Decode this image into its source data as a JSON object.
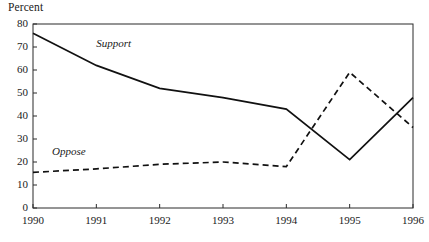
{
  "chart_data": {
    "type": "line",
    "title": "",
    "ylabel": "Percent",
    "xlabel": "",
    "x": [
      1990,
      1991,
      1992,
      1993,
      1994,
      1995,
      1996
    ],
    "xtick_labels": [
      "1990",
      "1991",
      "1992",
      "1993",
      "1994",
      "1995",
      "1996"
    ],
    "ytick_labels": [
      "0",
      "10",
      "20",
      "30",
      "40",
      "50",
      "60",
      "70",
      "80"
    ],
    "yticks": [
      0,
      10,
      20,
      30,
      40,
      50,
      60,
      70,
      80
    ],
    "ylim": [
      0,
      80
    ],
    "xlim": [
      1990,
      1996
    ],
    "grid": false,
    "legend": "inline-labels",
    "series": [
      {
        "name": "Support",
        "style": "solid",
        "color": "#111111",
        "values": [
          76,
          62,
          52,
          48,
          43,
          21,
          48
        ]
      },
      {
        "name": "Oppose",
        "style": "dashed",
        "color": "#111111",
        "values": [
          15.5,
          17,
          19,
          20,
          18,
          59,
          35
        ]
      }
    ],
    "annotations": [
      {
        "text": "Support",
        "x": 1991.0,
        "y": 71
      },
      {
        "text": "Oppose",
        "x": 1990.3,
        "y": 24
      }
    ]
  },
  "axis": {
    "y_title": "Percent"
  },
  "labels": {
    "support": "Support",
    "oppose": "Oppose"
  }
}
